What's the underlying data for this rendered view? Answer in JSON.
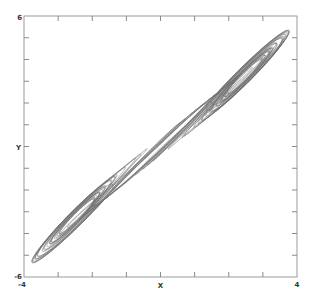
{
  "chart_data": {
    "type": "line",
    "title": "",
    "xlabel": "X",
    "ylabel": "Y",
    "xlim": [
      -4,
      4
    ],
    "ylim": [
      -6,
      6
    ],
    "x_tick_labels": [
      "-4",
      "4"
    ],
    "y_tick_labels": [
      "-6",
      "6"
    ],
    "x_ticks": [
      -4,
      -3,
      -2,
      -1,
      0,
      1,
      2,
      3,
      4
    ],
    "y_ticks": [
      -6,
      -5,
      -4,
      -3,
      -2,
      -1,
      0,
      1,
      2,
      3,
      4,
      5,
      6
    ],
    "grid": false,
    "legend": "none",
    "line_color": "#6e6e6e",
    "series": [
      {
        "name": "trajectory",
        "approx_extent": {
          "x_min": -2.9,
          "x_max": 3.1,
          "y_min": -4.7,
          "y_max": 5.0
        },
        "scroll_centers": [
          {
            "x": -1.3,
            "y": -1.7
          },
          {
            "x": 1.3,
            "y": 1.7
          }
        ]
      }
    ]
  }
}
